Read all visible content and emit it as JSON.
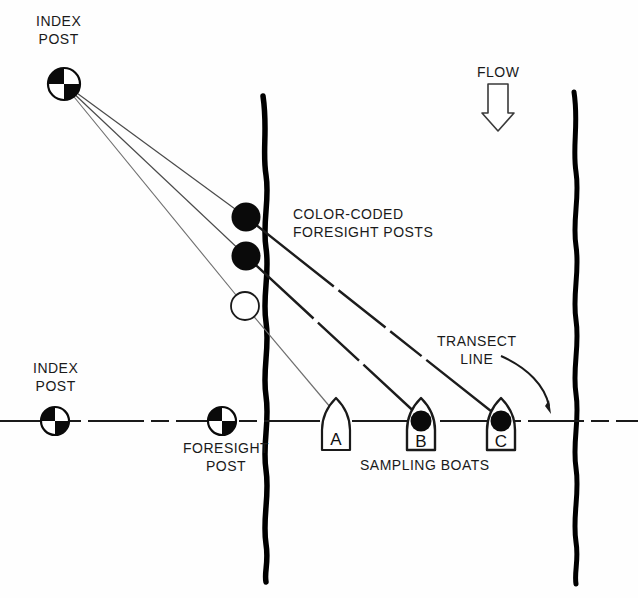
{
  "figure": {
    "type": "survey-schematic"
  },
  "labels": {
    "index_post_top": "INDEX\nPOST",
    "index_post_left": "INDEX\nPOST",
    "foresight_post": "FORESIGHT\nPOST",
    "color_coded_foresight_posts": "COLOR-CODED\nFORESIGHT POSTS",
    "transect_line": "TRANSECT\nLINE",
    "flow": "FLOW",
    "sampling_boats": "SAMPLING BOATS"
  },
  "boats": [
    {
      "id": "A",
      "label": "A",
      "cx": 336,
      "cy": 424,
      "marker": "open"
    },
    {
      "id": "B",
      "label": "B",
      "cx": 421,
      "cy": 424,
      "marker": "filled"
    },
    {
      "id": "C",
      "label": "C",
      "cx": 501,
      "cy": 424,
      "marker": "filled"
    }
  ],
  "foresight_posts": [
    {
      "id": "post-1",
      "cx": 246,
      "cy": 217,
      "fill": "filled"
    },
    {
      "id": "post-2",
      "cx": 246,
      "cy": 256,
      "fill": "filled"
    },
    {
      "id": "post-3",
      "cx": 245,
      "cy": 306,
      "fill": "open"
    }
  ],
  "survey_markers": [
    {
      "id": "index-post-top",
      "cx": 64,
      "cy": 84,
      "r": 16
    },
    {
      "id": "index-post-left",
      "cx": 55,
      "cy": 421,
      "r": 14
    },
    {
      "id": "foresight-post-transect",
      "cx": 222,
      "cy": 421,
      "r": 14
    }
  ],
  "colors": {
    "ink": "#111111",
    "bank": "#000000",
    "sight_line": "#2b2b2b",
    "faint_line": "#6e6e6e",
    "paper": "#fefefe"
  },
  "geometry": {
    "transect_line_y": 421,
    "left_bank_x": 266,
    "right_bank_x": 577
  },
  "icons": {
    "flow_arrow": "down-arrow-outline",
    "survey_marker": "quartered-circle-marker"
  }
}
